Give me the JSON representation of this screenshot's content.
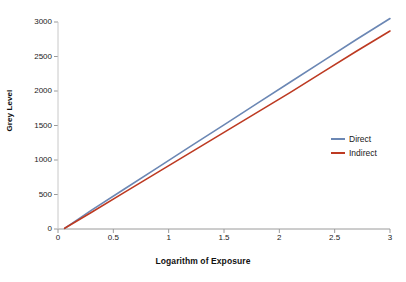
{
  "chart_data": {
    "type": "line",
    "title": "",
    "xlabel": "Logarithm of Exposure",
    "ylabel": "Grey Level",
    "xlim": [
      0,
      3
    ],
    "ylim": [
      0,
      3000
    ],
    "xticks": [
      "0",
      "0.5",
      "1",
      "1.5",
      "2",
      "2.5",
      "3"
    ],
    "xtick_values": [
      0,
      0.5,
      1,
      1.5,
      2,
      2.5,
      3
    ],
    "yticks": [
      "0",
      "500",
      "1000",
      "1500",
      "2000",
      "2500",
      "3000"
    ],
    "ytick_values": [
      0,
      500,
      1000,
      1500,
      2000,
      2500,
      3000
    ],
    "grid": false,
    "legend_position": "right-inside",
    "background": "#ffffff",
    "x": [
      0.06,
      0.3,
      0.6,
      0.9,
      1.2,
      1.5,
      1.8,
      2.1,
      2.4,
      2.7,
      3.0
    ],
    "series": [
      {
        "name": "Direct",
        "color": "#6b87b4",
        "values": [
          10,
          270,
          580,
          890,
          1200,
          1510,
          1820,
          2130,
          2440,
          2750,
          3050
        ]
      },
      {
        "name": "Indirect",
        "color": "#bd3a22",
        "values": [
          10,
          240,
          530,
          820,
          1110,
          1400,
          1690,
          1980,
          2280,
          2580,
          2870
        ]
      }
    ]
  },
  "legend": {
    "items": [
      {
        "label": "Direct",
        "color": "#6b87b4"
      },
      {
        "label": "Indirect",
        "color": "#bd3a22"
      }
    ]
  },
  "axis_color": "#9a9a9a"
}
